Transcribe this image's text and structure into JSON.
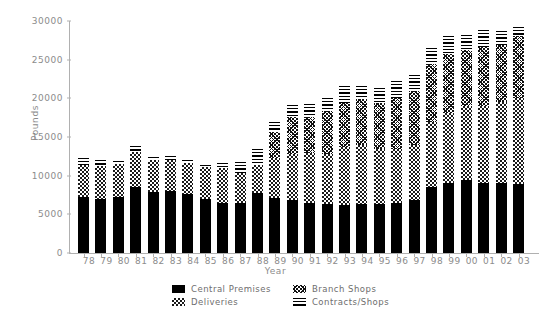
{
  "chart_data": {
    "type": "bar",
    "stacked": true,
    "title": "",
    "xlabel": "Year",
    "ylabel": "Pounds",
    "ylim": [
      0,
      30000
    ],
    "yticks": [
      0,
      5000,
      10000,
      15000,
      20000,
      25000,
      30000
    ],
    "ytick_labels": [
      "0",
      "5000",
      "10000",
      "15000",
      "20000",
      "25000",
      "30000"
    ],
    "grid": false,
    "legend_position": "bottom",
    "categories": [
      "78",
      "79",
      "80",
      "81",
      "82",
      "83",
      "84",
      "85",
      "86",
      "87",
      "88",
      "89",
      "90",
      "91",
      "92",
      "93",
      "94",
      "95",
      "96",
      "97",
      "98",
      "99",
      "00",
      "01",
      "02",
      "03"
    ],
    "series": [
      {
        "name": "Central Premises",
        "pattern": "solid-black",
        "color": "#000000",
        "values": [
          7200,
          7000,
          7200,
          8500,
          7900,
          8000,
          7600,
          7000,
          6500,
          6500,
          7700,
          7100,
          6900,
          6500,
          6400,
          6200,
          6300,
          6300,
          6500,
          6800,
          8600,
          9100,
          9500,
          9000,
          9000,
          8900
        ]
      },
      {
        "name": "Deliveries",
        "pattern": "checkerboard",
        "color": "#1a1a1a",
        "values": [
          4200,
          4200,
          4300,
          4500,
          4100,
          4000,
          4000,
          4100,
          4500,
          3900,
          3700,
          5200,
          5900,
          6400,
          6400,
          7500,
          7700,
          7100,
          6900,
          7200,
          8400,
          9000,
          9500,
          10000,
          10500,
          11200
        ]
      },
      {
        "name": "Branch Shops",
        "pattern": "cross-hatch",
        "color": "#111111",
        "values": [
          0,
          0,
          0,
          0,
          0,
          0,
          0,
          0,
          0,
          0,
          0,
          3400,
          4800,
          4700,
          5600,
          5700,
          5900,
          6000,
          6700,
          7000,
          7400,
          7600,
          7200,
          7700,
          7400,
          7900
        ]
      },
      {
        "name": "Contracts/Shops",
        "pattern": "horizontal-lines",
        "color": "#000000",
        "values": [
          900,
          800,
          400,
          900,
          400,
          500,
          400,
          300,
          700,
          1400,
          2100,
          1300,
          1600,
          1700,
          1600,
          2200,
          1700,
          1900,
          2100,
          2000,
          2100,
          2400,
          2000,
          2100,
          1800,
          1200
        ]
      }
    ],
    "totals": [
      12300,
      12000,
      11900,
      13900,
      12400,
      12500,
      12000,
      11500,
      11700,
      11700,
      13500,
      17000,
      19200,
      19300,
      20000,
      21600,
      21600,
      21300,
      22200,
      23000,
      26500,
      28100,
      28200,
      28800,
      28700,
      29200
    ]
  },
  "legend": {
    "items": [
      {
        "label": "Central Premises",
        "pattern": "solid-black"
      },
      {
        "label": "Branch Shops",
        "pattern": "cross-hatch"
      },
      {
        "label": "Deliveries",
        "pattern": "checkerboard"
      },
      {
        "label": "Contracts/Shops",
        "pattern": "horizontal-lines"
      }
    ]
  },
  "axes": {
    "y_title": "Pounds",
    "x_title": "Year"
  },
  "colors": {
    "background": "#ffffff",
    "axis": "#b0b0b0",
    "text": "#8c8c8c",
    "ink": "#000000"
  }
}
